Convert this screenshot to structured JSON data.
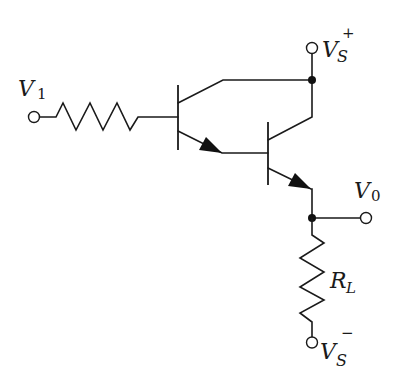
{
  "diagram": {
    "type": "circuit",
    "colors": {
      "line": "#1a1a1a",
      "background": "#ffffff"
    },
    "labels": {
      "input": {
        "main": "V",
        "sub": "1"
      },
      "supply_pos": {
        "main": "V",
        "sub": "S",
        "sup": "+"
      },
      "output": {
        "main": "V",
        "sub": "0"
      },
      "load": {
        "main": "R",
        "sub": "L"
      },
      "supply_neg": {
        "main": "V",
        "sub": "S",
        "sup": "−"
      }
    },
    "components": [
      {
        "id": "input-resistor",
        "type": "resistor"
      },
      {
        "id": "transistor-q1",
        "type": "npn-bjt"
      },
      {
        "id": "transistor-q2",
        "type": "npn-bjt"
      },
      {
        "id": "load-resistor",
        "type": "resistor",
        "label": "RL"
      }
    ],
    "terminals": [
      "V1",
      "VS+",
      "V0",
      "VS-"
    ]
  }
}
